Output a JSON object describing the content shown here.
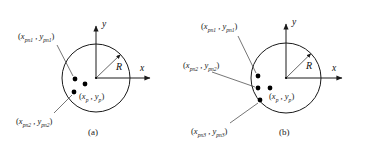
{
  "diagram": {
    "type": "geometry-diagram",
    "colors": {
      "stroke": "#1a1a1a",
      "point_fill": "#000000",
      "leader_line": "#3b3b3b",
      "background": "#ffffff"
    },
    "figures": [
      {
        "id": "a",
        "caption": "(a)",
        "axis_x_label": "x",
        "axis_y_label": "y",
        "radius_label": "R",
        "center_label": {
          "open": "(",
          "x_var": "x",
          "x_sub": "p",
          "sep": " , ",
          "y_var": "y",
          "y_sub": "p",
          "close": ")"
        },
        "circle": {
          "cx": 96,
          "cy": 78,
          "r": 34
        },
        "points": [
          {
            "name": "point-1",
            "cx": 75,
            "cy": 79,
            "r": 2.4,
            "labeled": true
          },
          {
            "name": "point-2",
            "cx": 85,
            "cy": 84,
            "r": 2.4,
            "labeled": false
          },
          {
            "name": "point-3",
            "cx": 74,
            "cy": 92,
            "r": 2.4,
            "labeled": true
          }
        ],
        "labels": [
          {
            "name": "point-label-pn1",
            "open": "(",
            "x_var": "x",
            "x_sub": "pn1",
            "sep": " , ",
            "y_var": "y",
            "y_sub": "pn1",
            "close": ")",
            "left": 18,
            "top": 32,
            "leader": {
              "x1": 57,
              "y1": 45,
              "x2": 73,
              "y2": 76
            }
          },
          {
            "name": "point-label-pn2",
            "open": "(",
            "x_var": "x",
            "x_sub": "pn2",
            "sep": " , ",
            "y_var": "y",
            "y_sub": "pn2",
            "close": ")",
            "left": 16,
            "top": 117,
            "leader": {
              "x1": 54,
              "y1": 113,
              "x2": 72,
              "y2": 95
            }
          }
        ]
      },
      {
        "id": "b",
        "caption": "(b)",
        "axis_x_label": "x",
        "axis_y_label": "y",
        "radius_label": "R",
        "center_label": {
          "open": "(",
          "x_var": "x",
          "x_sub": "p",
          "sep": " , ",
          "y_var": "y",
          "y_sub": "p",
          "close": ")"
        },
        "circle": {
          "cx": 101,
          "cy": 78,
          "r": 35
        },
        "points": [
          {
            "name": "point-1",
            "cx": 73,
            "cy": 76,
            "r": 2.4,
            "labeled": true
          },
          {
            "name": "point-2",
            "cx": 73,
            "cy": 88,
            "r": 2.4,
            "labeled": true
          },
          {
            "name": "point-3",
            "cx": 85,
            "cy": 88,
            "r": 2.4,
            "labeled": false
          },
          {
            "name": "point-4",
            "cx": 75,
            "cy": 100,
            "r": 2.4,
            "labeled": true
          }
        ],
        "labels": [
          {
            "name": "point-label-pn1",
            "open": "(",
            "x_var": "x",
            "x_sub": "pn1",
            "sep": " , ",
            "y_var": "y",
            "y_sub": "pn1",
            "close": ")",
            "left": 16,
            "top": 22,
            "leader": {
              "x1": 53,
              "y1": 36,
              "x2": 71,
              "y2": 73
            }
          },
          {
            "name": "point-label-pn2",
            "open": "(",
            "x_var": "x",
            "x_sub": "pn2",
            "sep": " , ",
            "y_var": "y",
            "y_sub": "pn2",
            "close": ")",
            "left": -2,
            "top": 61,
            "leader": {
              "x1": 27,
              "y1": 72,
              "x2": 70,
              "y2": 87
            }
          },
          {
            "name": "point-label-pn3",
            "open": "(",
            "x_var": "x",
            "x_sub": "pn3",
            "sep": " , ",
            "y_var": "y",
            "y_sub": "pn3",
            "close": ")",
            "left": 6,
            "top": 127,
            "leader": {
              "x1": 45,
              "y1": 123,
              "x2": 73,
              "y2": 103
            }
          }
        ]
      }
    ]
  }
}
